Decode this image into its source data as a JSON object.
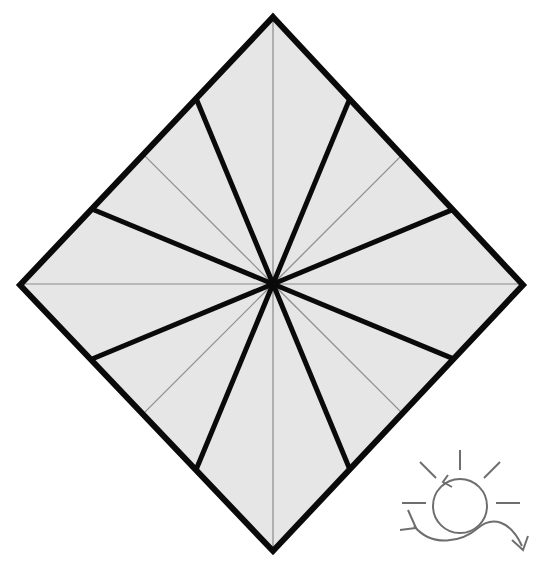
{
  "canvas": {
    "width": 536,
    "height": 569,
    "background_color": "#ffffff"
  },
  "figure": {
    "name": "diamond-fan-diagram",
    "shape": "diamond",
    "description": "Rotated square (diamond) subdivided into 16 triangular sectors by straight spokes radiating from the centre point; spokes alternate between thick black and thin grey strokes.",
    "center": {
      "x": 273,
      "y": 284
    },
    "vertices": {
      "top": {
        "x": 273,
        "y": 17
      },
      "right": {
        "x": 523,
        "y": 285
      },
      "bottom": {
        "x": 273,
        "y": 551
      },
      "left": {
        "x": 20,
        "y": 285
      }
    },
    "fill_color": "#e6e6e6",
    "outline_color": "#0a0a0a",
    "outline_width": 6,
    "thick_spoke_color": "#0a0a0a",
    "thick_spoke_width": 5,
    "thin_spoke_color": "#8a8a8a",
    "thin_spoke_width": 1.2,
    "sector_count": 16,
    "spoke_count": 16,
    "spoke_angles_deg": [
      0,
      22.5,
      45,
      67.5,
      90,
      112.5,
      135,
      157.5,
      180,
      202.5,
      225,
      247.5,
      270,
      292.5,
      315,
      337.5
    ],
    "spoke_weights": [
      "thin",
      "thick",
      "thin",
      "thick",
      "thin",
      "thick",
      "thin",
      "thick",
      "thin",
      "thick",
      "thin",
      "thick",
      "thin",
      "thick",
      "thin",
      "thick"
    ]
  },
  "corner_icon": {
    "name": "rotation-sun-icon",
    "label": "rotation-sun-icon",
    "stroke_color": "#6e6e6e",
    "stroke_width": 2,
    "position": {
      "x": 392,
      "y": 448,
      "width": 140,
      "height": 110
    },
    "parts": {
      "circle_label": "circle-with-counterclockwise-arrow",
      "ray_label": "sun-rays",
      "curve_label": "s-curve-double-arrow",
      "ray_count": 5
    }
  }
}
